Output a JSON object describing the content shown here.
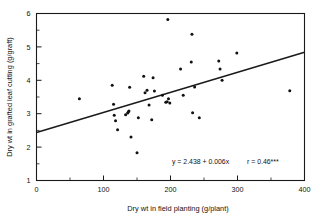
{
  "chart_data": {
    "type": "scatter",
    "title": "",
    "xlabel": "Dry wt in field planting (g/plant)",
    "ylabel": "Dry wt in grafted leaf cutting (g/graft)",
    "xlim": [
      0,
      400
    ],
    "ylim": [
      1,
      6
    ],
    "xticks": [
      0,
      100,
      200,
      300,
      400
    ],
    "xtick_labels": [
      "0",
      "100",
      "200",
      "300",
      "400"
    ],
    "yticks": [
      1,
      2,
      3,
      4,
      5,
      6
    ],
    "ytick_labels": [
      "1",
      "2",
      "3",
      "4",
      "5",
      "6"
    ],
    "x_minor_tick_interval": 50,
    "y_minor_tick_interval": 0.5,
    "grid": false,
    "legend": false,
    "marker": "filled-circle",
    "marker_color": "#111111",
    "points": [
      [
        64,
        3.45
      ],
      [
        113,
        3.85
      ],
      [
        115,
        3.28
      ],
      [
        116,
        2.95
      ],
      [
        118,
        2.79
      ],
      [
        121,
        2.52
      ],
      [
        133,
        2.97
      ],
      [
        136,
        3.02
      ],
      [
        137,
        3.05
      ],
      [
        138,
        3.08
      ],
      [
        139,
        3.79
      ],
      [
        141,
        2.3
      ],
      [
        150,
        1.83
      ],
      [
        152,
        2.88
      ],
      [
        160,
        4.12
      ],
      [
        162,
        3.63
      ],
      [
        165,
        3.7
      ],
      [
        168,
        3.26
      ],
      [
        172,
        2.82
      ],
      [
        174,
        4.08
      ],
      [
        176,
        3.68
      ],
      [
        188,
        3.55
      ],
      [
        193,
        3.34
      ],
      [
        195,
        3.36
      ],
      [
        196,
        5.82
      ],
      [
        197,
        3.45
      ],
      [
        199,
        3.32
      ],
      [
        215,
        4.34
      ],
      [
        219,
        3.55
      ],
      [
        231,
        4.55
      ],
      [
        232,
        5.38
      ],
      [
        233,
        3.03
      ],
      [
        236,
        3.8
      ],
      [
        243,
        2.88
      ],
      [
        272,
        4.58
      ],
      [
        274,
        4.34
      ],
      [
        277,
        4.0
      ],
      [
        299,
        4.82
      ],
      [
        378,
        3.69
      ]
    ],
    "fit_line": {
      "intercept": 2.438,
      "slope": 0.006,
      "x_start": 0,
      "x_end": 400,
      "y_start": 2.438,
      "y_end": 4.838
    },
    "annotation": {
      "equation": "y = 2.438 + 0.006x",
      "correlation": "r = 0.46***"
    }
  }
}
